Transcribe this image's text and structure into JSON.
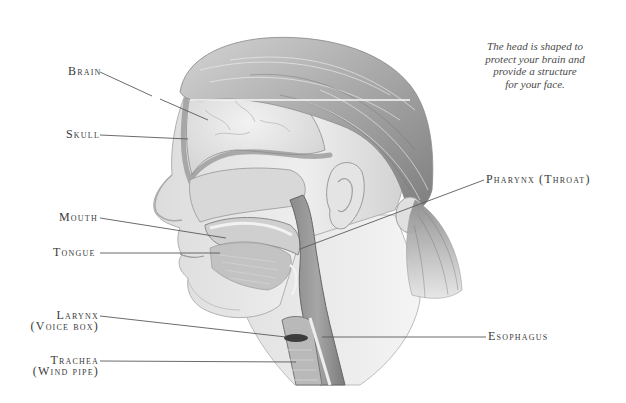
{
  "caption": {
    "line1": "The head is shaped to",
    "line2": "protect your brain and",
    "line3": "provide a structure",
    "line4": "for your face."
  },
  "labels": {
    "brain": "Brain",
    "skull": "Skull",
    "mouth": "Mouth",
    "tongue": "Tongue",
    "larynx": "Larynx",
    "larynx_sub": "(Voice box)",
    "trachea": "Trachea",
    "trachea_sub": "(Wind pipe)",
    "pharynx": "Pharynx (Throat)",
    "esophagus": "Esophagus"
  },
  "colors": {
    "background": "#ffffff",
    "leader_line": "#5a5a5a",
    "label_text": "#3a3a3a",
    "skin_light": "#e8e8e8",
    "skin_mid": "#bdbdbd",
    "hair_dark": "#8c8c8c",
    "tissue_dark": "#6e6e6e"
  }
}
